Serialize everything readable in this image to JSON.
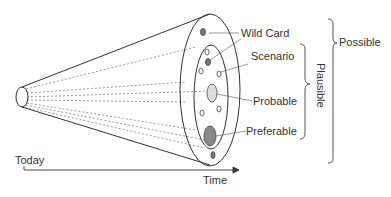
{
  "diagram": {
    "axis": {
      "start_label": "Today",
      "end_label": "Time"
    },
    "labels": {
      "wild_card": "Wild Card",
      "scenario": "Scenario",
      "probable": "Probable",
      "preferable": "Preferable",
      "plausible": "Plausible",
      "possible": "Possible"
    },
    "colors": {
      "line": "#333333",
      "wild_card_fill": "#777777",
      "probable_fill": "#dddddd",
      "preferable_fill": "#888888"
    }
  }
}
